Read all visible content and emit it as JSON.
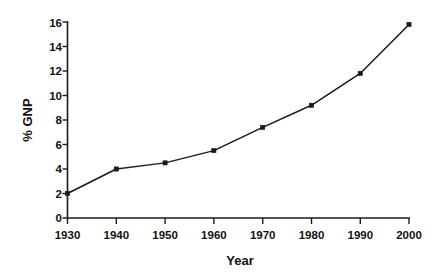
{
  "chart_data": {
    "type": "line",
    "title": "",
    "xlabel": "Year",
    "ylabel": "% GNP",
    "x": [
      1930,
      1940,
      1950,
      1960,
      1970,
      1980,
      1990,
      2000
    ],
    "categories": [
      "1930",
      "1940",
      "1950",
      "1960",
      "1970",
      "1980",
      "1990",
      "2000"
    ],
    "values": [
      2.0,
      4.0,
      4.5,
      5.5,
      7.4,
      9.2,
      11.8,
      15.8
    ],
    "series": [
      {
        "name": "% GNP",
        "values": [
          2.0,
          4.0,
          4.5,
          5.5,
          7.4,
          9.2,
          11.8,
          15.8
        ]
      }
    ],
    "xlim": [
      1930,
      2000
    ],
    "ylim": [
      0,
      16
    ],
    "xticks": [
      1930,
      1940,
      1950,
      1960,
      1970,
      1980,
      1990,
      2000
    ],
    "yticks": [
      0,
      2,
      4,
      6,
      8,
      10,
      12,
      14,
      16
    ],
    "xtick_labels": [
      "1930",
      "1940",
      "1950",
      "1960",
      "1970",
      "1980",
      "1990",
      "2000"
    ],
    "ytick_labels": [
      "0",
      "2",
      "4",
      "6",
      "8",
      "10",
      "12",
      "14",
      "16"
    ],
    "grid": false,
    "legend": false,
    "legend_position": "none",
    "marker": "square",
    "line_color": "#1a1a1a",
    "marker_color": "#1a1a1a",
    "background_color": "#ffffff"
  },
  "axes": {
    "x_title": "Year",
    "y_title": "% GNP"
  },
  "ytick_labels": {
    "t0": "0",
    "t1": "2",
    "t2": "4",
    "t3": "6",
    "t4": "8",
    "t5": "10",
    "t6": "12",
    "t7": "14",
    "t8": "16"
  },
  "xtick_labels": {
    "t0": "1930",
    "t1": "1940",
    "t2": "1950",
    "t3": "1960",
    "t4": "1970",
    "t5": "1980",
    "t6": "1990",
    "t7": "2000"
  }
}
